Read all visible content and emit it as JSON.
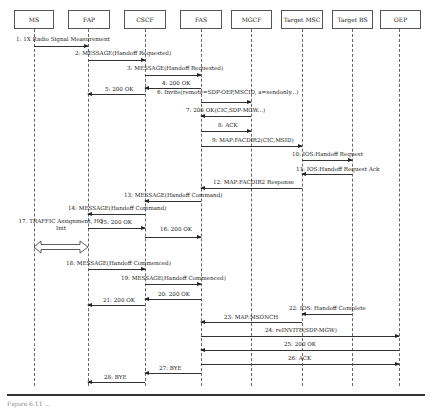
{
  "diagram": {
    "type": "sequence-diagram",
    "entities": [
      {
        "id": "ms",
        "label": "MS",
        "x": 34,
        "box_left": 14,
        "box_width": 40
      },
      {
        "id": "fap",
        "label": "FAP",
        "x": 88,
        "box_left": 68,
        "box_width": 42
      },
      {
        "id": "cscf",
        "label": "CSCF",
        "x": 145,
        "box_left": 124,
        "box_width": 42
      },
      {
        "id": "fas",
        "label": "FAS",
        "x": 201,
        "box_left": 180,
        "box_width": 42
      },
      {
        "id": "mgcf",
        "label": "MGCF",
        "x": 251,
        "box_left": 231,
        "box_width": 41
      },
      {
        "id": "target-msc",
        "label": "Target MSC",
        "x": 302,
        "box_left": 281,
        "box_width": 42
      },
      {
        "id": "target-bs",
        "label": "Target BS",
        "x": 352,
        "box_left": 332,
        "box_width": 41
      },
      {
        "id": "oep",
        "label": "OEP",
        "x": 399,
        "box_left": 380,
        "box_width": 41
      }
    ],
    "messages": [
      {
        "n": 1,
        "label": "1: 1X Radio Signal Measurement",
        "from": "ms",
        "to": "fap",
        "y": 46,
        "label_y": 36,
        "label_x": 16
      },
      {
        "n": 2,
        "label": "2: MESSAGE(Handoff Requested)",
        "from": "fap",
        "to": "cscf",
        "y": 60,
        "label_y": 50,
        "label_x": 75
      },
      {
        "n": 3,
        "label": "3: MESSAGE(Handoff Requested)",
        "from": "cscf",
        "to": "fas",
        "y": 75,
        "label_y": 65,
        "label_x": 127
      },
      {
        "n": 4,
        "label": "4: 200 OK",
        "from": "fas",
        "to": "cscf",
        "y": 88,
        "label_y": 80,
        "label_x": 162
      },
      {
        "n": 5,
        "label": "5: 200 OK",
        "from": "cscf",
        "to": "fap",
        "y": 94,
        "label_y": 86,
        "label_x": 105
      },
      {
        "n": 6,
        "label": "6: Invite(remote=SDP-OEP,MSCID, a=sendonly...)",
        "from": "fas",
        "to": "mgcf",
        "y": 102,
        "label_y": 89,
        "label_x": 157
      },
      {
        "n": 7,
        "label": "7: 200 OK(CIC,SDP-MGW...)",
        "from": "mgcf",
        "to": "fas",
        "y": 116,
        "label_y": 107,
        "label_x": 186
      },
      {
        "n": 8,
        "label": "8: ACK",
        "from": "fas",
        "to": "mgcf",
        "y": 131,
        "label_y": 122,
        "label_x": 218
      },
      {
        "n": 9,
        "label": "9: MAP:FACDIR2(CIC,MSID)",
        "from": "fas",
        "to": "target-msc",
        "y": 146,
        "label_y": 137,
        "label_x": 212
      },
      {
        "n": 10,
        "label": "10: IOS:Handoff Request",
        "from": "target-msc",
        "to": "target-bs",
        "y": 160,
        "label_y": 151,
        "label_x": 292
      },
      {
        "n": 11,
        "label": "11: IOS:Handoff Request Ack",
        "from": "target-bs",
        "to": "target-msc",
        "y": 174,
        "label_y": 166,
        "label_x": 296
      },
      {
        "n": 12,
        "label": "12: MAP:FACDIR2 Response",
        "from": "target-msc",
        "to": "fas",
        "y": 188,
        "label_y": 179,
        "label_x": 213
      },
      {
        "n": 13,
        "label": "13: MESSAGE(Handoff Command)",
        "from": "fas",
        "to": "cscf",
        "y": 201,
        "label_y": 192,
        "label_x": 124
      },
      {
        "n": 14,
        "label": "14: MESSAGE(Handoff Command)",
        "from": "cscf",
        "to": "fap",
        "y": 214,
        "label_y": 205,
        "label_x": 68
      },
      {
        "n": 15,
        "label": "15: 200 OK",
        "from": "fap",
        "to": "cscf",
        "y": 228,
        "label_y": 219,
        "label_x": 100
      },
      {
        "n": 16,
        "label": "16: 200 OK",
        "from": "cscf",
        "to": "fas",
        "y": 237,
        "label_y": 226,
        "label_x": 160
      },
      {
        "n": 18,
        "label": "18: MESSAGE(Handoff Commenced)",
        "from": "fap",
        "to": "cscf",
        "y": 269,
        "label_y": 260,
        "label_x": 66
      },
      {
        "n": 19,
        "label": "19: MESSAGE(Handoff Commenced)",
        "from": "cscf",
        "to": "fas",
        "y": 284,
        "label_y": 275,
        "label_x": 121
      },
      {
        "n": 20,
        "label": "20: 200 OK",
        "from": "fas",
        "to": "cscf",
        "y": 299,
        "label_y": 291,
        "label_x": 158
      },
      {
        "n": 21,
        "label": "21: 200 OK",
        "from": "cscf",
        "to": "fap",
        "y": 305,
        "label_y": 297,
        "label_x": 103
      },
      {
        "n": 22,
        "label": "22: IOS: Handoff Complete",
        "from": "target-bs",
        "to": "target-msc",
        "y": 314,
        "label_y": 305,
        "label_x": 289
      },
      {
        "n": 23,
        "label": "23: MAP:MSONCH",
        "from": "target-msc",
        "to": "fas",
        "y": 322,
        "label_y": 314,
        "label_x": 224
      },
      {
        "n": 24,
        "label": "24: reINVITE(SDP-MGW)",
        "from": "fas",
        "to": "oep",
        "y": 336,
        "label_y": 327,
        "label_x": 265
      },
      {
        "n": 25,
        "label": "25: 200 OK",
        "from": "oep",
        "to": "fas",
        "y": 350,
        "label_y": 341,
        "label_x": 284
      },
      {
        "n": 26,
        "label": "26: ACK",
        "from": "fas",
        "to": "oep",
        "y": 364,
        "label_y": 355,
        "label_x": 288
      },
      {
        "n": 27,
        "label": "27: BYE",
        "from": "fas",
        "to": "cscf",
        "y": 373,
        "label_y": 365,
        "label_x": 159
      },
      {
        "n": 28,
        "label": "28: BYE",
        "from": "cscf",
        "to": "fap",
        "y": 382,
        "label_y": 374,
        "label_x": 104
      }
    ],
    "notes": [
      {
        "n": 17,
        "label": "17. TRAFFIC Assignment, HO Init",
        "between": [
          "ms",
          "fap"
        ],
        "y": 228,
        "double_arrow_y": 247
      }
    ],
    "caption": "Figure 6.11 ..."
  }
}
